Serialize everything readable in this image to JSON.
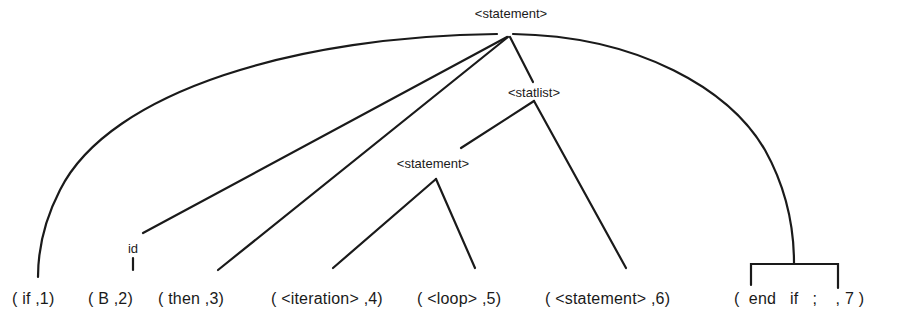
{
  "diagram": {
    "type": "parse-tree",
    "nodes": {
      "root": "<statement>",
      "statlist": "<statlist>",
      "inner_statement": "<statement>",
      "id": "id"
    },
    "tokens": [
      {
        "text": "( if ,1)"
      },
      {
        "text": "( B ,2)"
      },
      {
        "text": "( then ,3)"
      },
      {
        "text": "( <iteration> ,4)"
      },
      {
        "text": "( <loop> ,5)"
      },
      {
        "text": "(  <statement> ,6)"
      },
      {
        "text": "(  end   if   ;    , 7 )"
      }
    ],
    "edges": [
      {
        "from": "<statement>",
        "to": "( if ,1)"
      },
      {
        "from": "<statement>",
        "to": "id"
      },
      {
        "from": "id",
        "to": "( B ,2)"
      },
      {
        "from": "<statement>",
        "to": "( then ,3)"
      },
      {
        "from": "<statement>",
        "to": "<statlist>"
      },
      {
        "from": "<statlist>",
        "to": "<statement> (inner)"
      },
      {
        "from": "<statlist>",
        "to": "( <statement> ,6)"
      },
      {
        "from": "<statement> (inner)",
        "to": "( <iteration> ,4)"
      },
      {
        "from": "<statement> (inner)",
        "to": "( <loop> ,5)"
      },
      {
        "from": "<statement>",
        "to": "( end if ; ,7)"
      }
    ],
    "colors": {
      "line": "#1a1a1a",
      "background": "#ffffff"
    }
  }
}
